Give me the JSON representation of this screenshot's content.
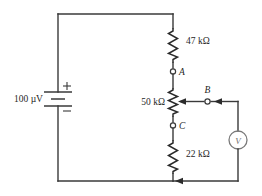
{
  "figure": {
    "type": "schematic-circuit-diagram",
    "title": "",
    "background_color": "#ffffff",
    "wire_color": "#3a3a3a",
    "component_color": "#2b2b2b",
    "meter_color": "#7a7a7a"
  },
  "source": {
    "name": "dc-voltage-source",
    "label": "100 µV",
    "plus_sign": "+",
    "minus_sign": "−",
    "polarity_top": "positive",
    "symbol": "battery-icon"
  },
  "components": [
    {
      "id": "r-47k",
      "name": "resistor-47k",
      "label": "47 kΩ",
      "symbol": "resistor-icon",
      "orientation": "vertical"
    },
    {
      "id": "r-50k-pot",
      "name": "potentiometer-50k",
      "label": "50 kΩ",
      "symbol": "potentiometer-icon",
      "orientation": "vertical",
      "has_wiper": true
    },
    {
      "id": "r-22k",
      "name": "resistor-22k",
      "label": "22 kΩ",
      "symbol": "resistor-icon",
      "orientation": "vertical"
    }
  ],
  "nodes": [
    {
      "id": "node-a",
      "name": "terminal-a",
      "label": "A"
    },
    {
      "id": "node-b",
      "name": "terminal-b",
      "label": "B"
    },
    {
      "id": "node-c",
      "name": "terminal-c",
      "label": "C"
    }
  ],
  "meter": {
    "name": "voltmeter",
    "label": "V",
    "symbol": "voltmeter-icon"
  }
}
